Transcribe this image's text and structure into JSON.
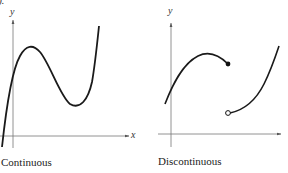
{
  "top_fragment": "y).",
  "graphs": [
    {
      "caption": "Continuous",
      "y_axis_label": "y",
      "x_axis_label": "x",
      "curve": "smooth cubic-like curve with local maximum and local minimum, unbroken"
    },
    {
      "caption": "Discontinuous",
      "y_axis_label": "y",
      "x_axis_label": "",
      "curve": "two pieces with a jump: left piece ends in a filled dot, right piece begins at an open dot below",
      "markers": [
        "filled-dot",
        "open-dot"
      ]
    }
  ],
  "colors": {
    "ink": "#1a1a1a",
    "axis": "#555555",
    "background": "#ffffff"
  }
}
